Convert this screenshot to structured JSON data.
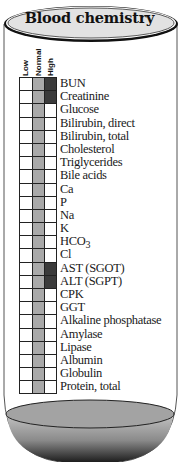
{
  "title": "Blood chemistry",
  "columns": [
    "Low",
    "Normal",
    "High"
  ],
  "colors": {
    "normal_fill": "#a9a9a9",
    "abnormal_fill": "#3b3b3b",
    "cap_fill": "#e2e2e2",
    "liquid_fill": "#9a9a9a"
  },
  "tests": [
    {
      "name": "BUN",
      "status": "High"
    },
    {
      "name": "Creatinine",
      "status": "High"
    },
    {
      "name": "Glucose",
      "status": "Normal"
    },
    {
      "name": "Bilirubin, direct",
      "status": "Normal"
    },
    {
      "name": "Bilirubin, total",
      "status": "Normal"
    },
    {
      "name": "Cholesterol",
      "status": "Normal"
    },
    {
      "name": "Triglycerides",
      "status": "Normal"
    },
    {
      "name": "Bile acids",
      "status": "Normal"
    },
    {
      "name": "Ca",
      "status": "Normal"
    },
    {
      "name": "P",
      "status": "Normal"
    },
    {
      "name": "Na",
      "status": "Normal"
    },
    {
      "name": "K",
      "status": "Normal"
    },
    {
      "name": "HCO3",
      "status": "Normal"
    },
    {
      "name": "Cl",
      "status": "Normal"
    },
    {
      "name": "AST (SGOT)",
      "status": "High"
    },
    {
      "name": "ALT (SGPT)",
      "status": "High"
    },
    {
      "name": "CPK",
      "status": "Normal"
    },
    {
      "name": "GGT",
      "status": "Normal"
    },
    {
      "name": "Alkaline phosphatase",
      "status": "Normal"
    },
    {
      "name": "Amylase",
      "status": "Normal"
    },
    {
      "name": "Lipase",
      "status": "Normal"
    },
    {
      "name": "Albumin",
      "status": "Normal"
    },
    {
      "name": "Globulin",
      "status": "Normal"
    },
    {
      "name": "Protein, total",
      "status": "Normal"
    }
  ]
}
